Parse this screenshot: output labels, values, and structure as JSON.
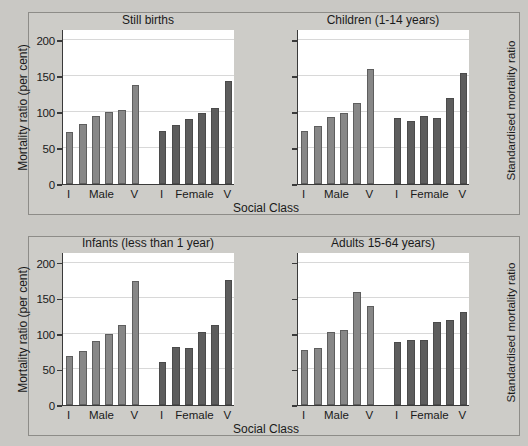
{
  "figure": {
    "background_color": "#c9c8c4",
    "panel_background_color": "#cdccc8",
    "plot_background_color": "#ffffff",
    "male_color": "#878787",
    "female_color": "#5d5d5d",
    "axis_color": "#3a3a3a",
    "grid_color": "#d8d8d8"
  },
  "axes": {
    "ylabel_left": "Mortality ratio (per cent)",
    "ylabel_right": "Standardised mortality ratio",
    "xlabel": "Social Class",
    "yticks": [
      0,
      50,
      100,
      150,
      200
    ],
    "ytick_labels": [
      "0",
      "50",
      "100",
      "150",
      "200"
    ],
    "ylim": [
      0,
      215
    ],
    "xtick_labels": [
      "I",
      "Male",
      "V",
      "I",
      "Female",
      "V"
    ],
    "group_labels": [
      "Male",
      "Female"
    ],
    "class_labels": [
      "I",
      "II",
      "IIIN",
      "IIIM",
      "IV",
      "V"
    ]
  },
  "chart_data": [
    {
      "type": "bar",
      "panel": "top-left",
      "title": "Still births",
      "xlabel": "Social Class",
      "ylabel": "Mortality ratio (per cent)",
      "ylim": [
        0,
        215
      ],
      "yticks": [
        0,
        50,
        100,
        150,
        200
      ],
      "grid": true,
      "legend": "none",
      "categories": [
        "I",
        "II",
        "IIIN",
        "IIIM",
        "IV",
        "V"
      ],
      "series": [
        {
          "name": "Male",
          "color": "#878787",
          "values": [
            72,
            83,
            95,
            100,
            102,
            138
          ]
        },
        {
          "name": "Female",
          "color": "#5d5d5d",
          "values": [
            73,
            82,
            90,
            99,
            105,
            143
          ]
        }
      ]
    },
    {
      "type": "bar",
      "panel": "top-right",
      "title": "Children (1-14 years)",
      "xlabel": "Social Class",
      "ylabel": "Standardised mortality ratio",
      "ylim": [
        0,
        215
      ],
      "yticks": [
        0,
        50,
        100,
        150,
        200
      ],
      "grid": true,
      "legend": "none",
      "categories": [
        "I",
        "II",
        "IIIN",
        "IIIM",
        "IV",
        "V"
      ],
      "series": [
        {
          "name": "Male",
          "color": "#878787",
          "values": [
            73,
            81,
            93,
            99,
            113,
            160
          ]
        },
        {
          "name": "Female",
          "color": "#5d5d5d",
          "values": [
            92,
            87,
            94,
            92,
            119,
            154
          ]
        }
      ]
    },
    {
      "type": "bar",
      "panel": "bottom-left",
      "title": "Infants (less than 1 year)",
      "xlabel": "Social Class",
      "ylabel": "Mortality ratio (per cent)",
      "ylim": [
        0,
        215
      ],
      "yticks": [
        0,
        50,
        100,
        150,
        200
      ],
      "grid": true,
      "legend": "none",
      "categories": [
        "I",
        "II",
        "IIIN",
        "IIIM",
        "IV",
        "V"
      ],
      "series": [
        {
          "name": "Male",
          "color": "#878787",
          "values": [
            69,
            76,
            90,
            100,
            113,
            174
          ]
        },
        {
          "name": "Female",
          "color": "#5d5d5d",
          "values": [
            61,
            81,
            80,
            102,
            112,
            175
          ]
        }
      ]
    },
    {
      "type": "bar",
      "panel": "bottom-right",
      "title": "Adults 15-64 years)",
      "xlabel": "Social Class",
      "ylabel": "Standardised mortality ratio",
      "ylim": [
        0,
        215
      ],
      "yticks": [
        0,
        50,
        100,
        150,
        200
      ],
      "grid": true,
      "legend": "none",
      "categories": [
        "I",
        "II",
        "IIIN",
        "IIIM",
        "IV",
        "V"
      ],
      "series": [
        {
          "name": "Male",
          "color": "#878787",
          "values": [
            78,
            80,
            103,
            105,
            159,
            139
          ]
        },
        {
          "name": "Female",
          "color": "#5d5d5d",
          "values": [
            88,
            92,
            92,
            116,
            120,
            131
          ]
        }
      ]
    }
  ]
}
